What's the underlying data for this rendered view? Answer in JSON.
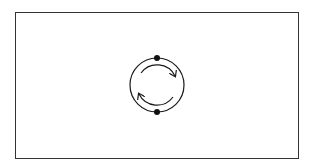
{
  "diagram": {
    "type": "cycle",
    "frame": {
      "x": 15,
      "y": 12,
      "width": 283,
      "height": 146,
      "stroke": "#333333"
    },
    "circle": {
      "cx": 157,
      "cy": 85,
      "r": 27,
      "stroke": "#1a1a1a"
    },
    "nodes": [
      {
        "name": "top-node",
        "cx": 157,
        "cy": 58,
        "r": 3
      },
      {
        "name": "bottom-node",
        "cx": 157,
        "cy": 112,
        "r": 3
      }
    ],
    "arrows": [
      {
        "name": "clockwise-arrow-top",
        "direction": "clockwise",
        "from": "upper-left",
        "to": "right"
      },
      {
        "name": "clockwise-arrow-bottom",
        "direction": "clockwise",
        "from": "lower-right",
        "to": "left"
      }
    ],
    "colors": {
      "background": "#ffffff",
      "ink": "#1a1a1a"
    }
  }
}
